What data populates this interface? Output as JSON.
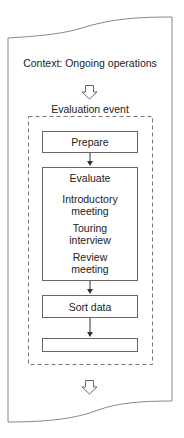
{
  "diagram": {
    "context_label": "Context: Ongoing operations",
    "event_label": "Evaluation event",
    "steps": [
      {
        "label": "Prepare"
      },
      {
        "label": "Evaluate",
        "substeps": [
          {
            "line1": "Introductory",
            "line2": "meeting"
          },
          {
            "line1": "Touring",
            "line2": "interview"
          },
          {
            "line1": "Review",
            "line2": "meeting"
          }
        ]
      },
      {
        "label": "Sort data"
      },
      {
        "label": "Respond"
      }
    ],
    "colors": {
      "stroke": "#666666",
      "text": "#222222",
      "background": "#ffffff"
    }
  }
}
